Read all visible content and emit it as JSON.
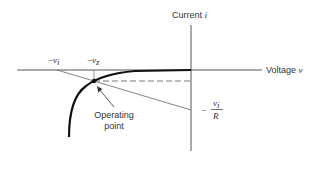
{
  "diagram": {
    "type": "diode load-line characteristic",
    "axes": {
      "vertical": {
        "label_text": "Current ",
        "label_var": "i"
      },
      "horizontal": {
        "label_text": "Voltage ",
        "label_var": "v"
      }
    },
    "tick_labels": {
      "neg_vi": {
        "sign": "−",
        "var": "v",
        "sub": "i"
      },
      "neg_vz": {
        "sign": "−",
        "var": "v",
        "sub": "z"
      }
    },
    "intercept_label": {
      "sign": "−",
      "numerator_var": "v",
      "numerator_sub": "i",
      "denominator": "R"
    },
    "annotation": {
      "line1": "Operating",
      "line2": "point"
    },
    "colors": {
      "axis": "#555555",
      "curve": "#111111",
      "text": "#333333",
      "background": "#ffffff"
    }
  }
}
